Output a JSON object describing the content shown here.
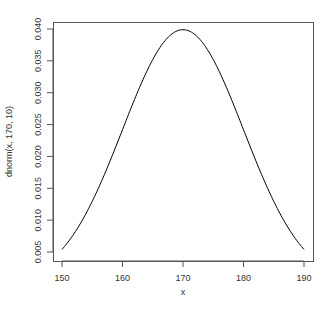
{
  "chart_data": {
    "type": "line",
    "title": "",
    "xlabel": "x",
    "ylabel": "dnorm(x, 170, 10)",
    "xlim": [
      150,
      190
    ],
    "ylim": [
      0.005,
      0.04
    ],
    "grid": false,
    "legend": null,
    "x_ticks": [
      150,
      160,
      170,
      180,
      190
    ],
    "x_tick_labels": [
      "150",
      "160",
      "170",
      "180",
      "190"
    ],
    "y_ticks": [
      0.005,
      0.01,
      0.015,
      0.02,
      0.025,
      0.03,
      0.035,
      0.04
    ],
    "y_tick_labels": [
      "0.005",
      "0.010",
      "0.015",
      "0.020",
      "0.025",
      "0.030",
      "0.035",
      "0.040"
    ],
    "series": [
      {
        "name": "dnorm(x, 170, 10)",
        "color": "#000000",
        "x": [
          150,
          152,
          154,
          156,
          158,
          160,
          162,
          164,
          166,
          168,
          170,
          172,
          174,
          176,
          178,
          180,
          182,
          184,
          186,
          188,
          190
        ],
        "values": [
          0.005399,
          0.007895,
          0.011092,
          0.014973,
          0.019419,
          0.024197,
          0.028969,
          0.033322,
          0.036827,
          0.039104,
          0.039894,
          0.039104,
          0.036827,
          0.033322,
          0.028969,
          0.024197,
          0.019419,
          0.014973,
          0.011092,
          0.007895,
          0.005399
        ]
      }
    ]
  },
  "layout": {
    "plot_box": {
      "left": 53,
      "top": 22,
      "right": 313,
      "bottom": 261
    },
    "x_px": {
      "min_val": 150,
      "max_val": 190,
      "min_px": 62,
      "max_px": 304
    },
    "y_px": {
      "min_val": 0.005,
      "max_val": 0.04,
      "min_px": 252,
      "max_px": 29
    },
    "axis_color": "#555555",
    "line_color": "#000000"
  }
}
